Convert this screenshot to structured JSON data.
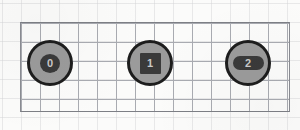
{
  "canvas": {
    "width": 300,
    "height": 130,
    "background_color": "#fbfbfa"
  },
  "grid": {
    "line_color": "#a9abb1",
    "border_color": "#7d7f85",
    "cell_size": 19,
    "origin_x": 20,
    "origin_y": 22,
    "grid_width": 268,
    "grid_height": 88,
    "columns": 14,
    "rows": 4
  },
  "style": {
    "node_fill": "#9b9b9b",
    "node_outline": "#1d1d1d",
    "badge_fill": "#3a3a3a",
    "badge_text_color": "#c9c9c9"
  },
  "nodes": [
    {
      "label": "0",
      "badge_shape": "circle",
      "center_x": 50,
      "center_y": 63,
      "diameter": 46
    },
    {
      "label": "1",
      "badge_shape": "square",
      "center_x": 150,
      "center_y": 63,
      "diameter": 46
    },
    {
      "label": "2",
      "badge_shape": "pill",
      "center_x": 248,
      "center_y": 63,
      "diameter": 46
    }
  ]
}
